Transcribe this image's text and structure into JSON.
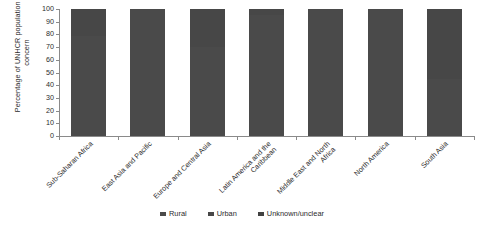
{
  "chart_data": {
    "type": "bar",
    "stacked": true,
    "stack_mode": "percent",
    "title": "",
    "xlabel": "",
    "ylabel": "Percentage of UNHCR population of concern",
    "ylim": [
      0,
      100
    ],
    "yticks": [
      0,
      10,
      20,
      30,
      40,
      50,
      60,
      70,
      80,
      90,
      100
    ],
    "grid": false,
    "legend_position": "bottom-center",
    "categories": [
      "Sub-Saharan Africa",
      "East Asia and Pacific",
      "Europe and Central Asia",
      "Latin America and the Caribbean",
      "Middle East and North Africa",
      "North America",
      "South Asia"
    ],
    "series": [
      {
        "name": "Rural",
        "color": "#4a4a4a",
        "values": [
          79,
          100,
          70,
          95,
          100,
          100,
          45
        ]
      },
      {
        "name": "Urban",
        "color": "#474747",
        "values": [
          21,
          0,
          30,
          5,
          0,
          0,
          55
        ]
      },
      {
        "name": "Unknown/unclear",
        "color": "#414141",
        "values": [
          0,
          0,
          0,
          0,
          0,
          0,
          0
        ]
      }
    ]
  },
  "axis": {
    "y_title": "Percentage of UNHCR population of concern",
    "tick_labels": [
      "100",
      "90",
      "80",
      "70",
      "60",
      "50",
      "40",
      "30",
      "20",
      "10",
      "0"
    ]
  },
  "legend": {
    "items": [
      {
        "label": "Rural",
        "color": "#4a4a4a"
      },
      {
        "label": "Urban",
        "color": "#474747"
      },
      {
        "label": "Unknown/unclear",
        "color": "#414141"
      }
    ]
  }
}
